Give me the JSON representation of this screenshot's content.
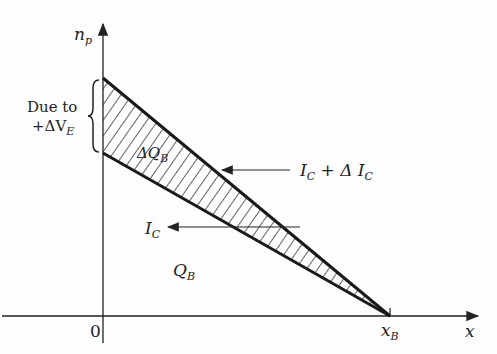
{
  "diagram": {
    "y_axis_label": {
      "main": "n",
      "sub": "p"
    },
    "x_axis_label": "x",
    "origin_label": "0",
    "xb_label": {
      "main": "x",
      "sub": "B"
    },
    "brace_label_line1": "Due to",
    "brace_label_line2": {
      "prefix": "+ΔV",
      "sub": "E"
    },
    "delta_qb_label": {
      "main": "ΔQ",
      "sub": "B"
    },
    "qb_label": {
      "main": "Q",
      "sub": "B"
    },
    "ic_label": {
      "main": "I",
      "sub": "C"
    },
    "ic_delta_label": {
      "main1": "I",
      "sub1": "C",
      "mid": " + Δ I",
      "sub2": "C"
    },
    "colors": {
      "ink": "#1a1a1a",
      "background": "#fdfdfd"
    }
  }
}
